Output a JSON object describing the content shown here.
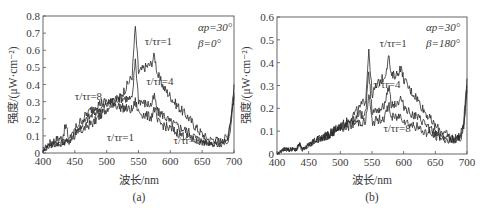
{
  "figure": {
    "panels": [
      {
        "id": "a",
        "caption": "(a)",
        "xlabel": "波长/nm",
        "ylabel": "强度/(μW·cm⁻²)",
        "params": [
          "αp=30°",
          "β=0°"
        ],
        "curve_labels": [
          {
            "text": "τ/τr=1",
            "x": 560,
            "y": 0.63
          },
          {
            "text": "τ/τr=4",
            "x": 562,
            "y": 0.4
          },
          {
            "text": "τ/τr=8",
            "x": 450,
            "y": 0.31
          },
          {
            "text": "τ/τr=1",
            "x": 500,
            "y": 0.07
          },
          {
            "text": "τ/τr=8",
            "x": 605,
            "y": 0.05
          }
        ]
      },
      {
        "id": "b",
        "caption": "(b)",
        "xlabel": "波长/nm",
        "ylabel": "强度/(μW·cm⁻²)",
        "params": [
          "αp=30°",
          "β=180°"
        ],
        "curve_labels": [
          {
            "text": "τ/τr=1",
            "x": 562,
            "y": 0.47
          },
          {
            "text": "τ/τr=4",
            "x": 552,
            "y": 0.29
          },
          {
            "text": "τ/τr=8",
            "x": 568,
            "y": 0.095
          }
        ]
      }
    ]
  },
  "chart_data": [
    {
      "type": "line",
      "title": "(a)",
      "xlabel": "波长/nm",
      "ylabel": "强度/(μW·cm⁻²)",
      "xlim": [
        400,
        700
      ],
      "ylim": [
        0,
        0.8
      ],
      "xticks": [
        400,
        450,
        500,
        550,
        600,
        650,
        700
      ],
      "yticks": [
        0,
        0.1,
        0.2,
        0.3,
        0.4,
        0.5,
        0.6,
        0.7,
        0.8
      ],
      "grid": false,
      "legend": "inline annotations",
      "annotations": [
        "αp=30°",
        "β=0°"
      ],
      "x": [
        400,
        410,
        420,
        430,
        436,
        440,
        450,
        460,
        470,
        480,
        490,
        500,
        510,
        520,
        530,
        540,
        545,
        550,
        560,
        570,
        575,
        580,
        590,
        600,
        610,
        620,
        630,
        640,
        650,
        660,
        670,
        680,
        690,
        695,
        700
      ],
      "series": [
        {
          "name": "τ/τr=1",
          "values": [
            0.02,
            0.06,
            0.08,
            0.09,
            0.16,
            0.09,
            0.1,
            0.13,
            0.16,
            0.18,
            0.22,
            0.26,
            0.3,
            0.32,
            0.38,
            0.45,
            0.74,
            0.47,
            0.5,
            0.52,
            0.57,
            0.46,
            0.38,
            0.33,
            0.28,
            0.24,
            0.2,
            0.15,
            0.11,
            0.08,
            0.08,
            0.07,
            0.1,
            0.2,
            0.4
          ]
        },
        {
          "name": "τ/τr=4",
          "values": [
            0.01,
            0.05,
            0.06,
            0.06,
            0.08,
            0.06,
            0.12,
            0.16,
            0.2,
            0.23,
            0.26,
            0.28,
            0.31,
            0.32,
            0.32,
            0.31,
            0.55,
            0.31,
            0.29,
            0.28,
            0.33,
            0.24,
            0.22,
            0.18,
            0.16,
            0.14,
            0.12,
            0.09,
            0.07,
            0.06,
            0.06,
            0.06,
            0.08,
            0.18,
            0.35
          ]
        },
        {
          "name": "τ/τr=8",
          "values": [
            0.01,
            0.04,
            0.05,
            0.05,
            0.07,
            0.05,
            0.14,
            0.19,
            0.23,
            0.27,
            0.29,
            0.3,
            0.29,
            0.27,
            0.26,
            0.25,
            0.3,
            0.24,
            0.22,
            0.21,
            0.26,
            0.18,
            0.16,
            0.14,
            0.12,
            0.1,
            0.09,
            0.07,
            0.06,
            0.05,
            0.05,
            0.05,
            0.07,
            0.16,
            0.33
          ]
        }
      ]
    },
    {
      "type": "line",
      "title": "(b)",
      "xlabel": "波长/nm",
      "ylabel": "强度/(μW·cm⁻²)",
      "xlim": [
        400,
        700
      ],
      "ylim": [
        0,
        0.6
      ],
      "xticks": [
        400,
        450,
        500,
        550,
        600,
        650,
        700
      ],
      "yticks": [
        0,
        0.1,
        0.2,
        0.3,
        0.4,
        0.5,
        0.6
      ],
      "grid": false,
      "legend": "inline annotations",
      "annotations": [
        "αp=30°",
        "β=180°"
      ],
      "x": [
        400,
        410,
        420,
        430,
        436,
        440,
        450,
        460,
        470,
        480,
        490,
        500,
        510,
        520,
        530,
        540,
        545,
        550,
        560,
        570,
        577,
        580,
        590,
        595,
        600,
        610,
        620,
        630,
        640,
        650,
        660,
        670,
        680,
        690,
        695,
        700
      ],
      "series": [
        {
          "name": "τ/τr=1",
          "values": [
            0.0,
            0.02,
            0.02,
            0.02,
            0.04,
            0.02,
            0.04,
            0.06,
            0.07,
            0.08,
            0.1,
            0.12,
            0.14,
            0.17,
            0.2,
            0.24,
            0.46,
            0.26,
            0.31,
            0.34,
            0.43,
            0.34,
            0.35,
            0.38,
            0.33,
            0.28,
            0.25,
            0.2,
            0.16,
            0.12,
            0.1,
            0.08,
            0.07,
            0.08,
            0.15,
            0.33
          ]
        },
        {
          "name": "τ/τr=4",
          "values": [
            0.0,
            0.02,
            0.02,
            0.02,
            0.04,
            0.02,
            0.04,
            0.06,
            0.07,
            0.08,
            0.1,
            0.12,
            0.13,
            0.15,
            0.17,
            0.18,
            0.36,
            0.19,
            0.2,
            0.21,
            0.3,
            0.22,
            0.22,
            0.24,
            0.21,
            0.18,
            0.16,
            0.14,
            0.11,
            0.09,
            0.08,
            0.07,
            0.06,
            0.08,
            0.13,
            0.3
          ]
        },
        {
          "name": "τ/τr=8",
          "values": [
            0.0,
            0.02,
            0.02,
            0.02,
            0.04,
            0.02,
            0.04,
            0.06,
            0.07,
            0.08,
            0.1,
            0.11,
            0.12,
            0.13,
            0.14,
            0.14,
            0.26,
            0.14,
            0.15,
            0.16,
            0.22,
            0.16,
            0.16,
            0.17,
            0.15,
            0.13,
            0.12,
            0.1,
            0.09,
            0.08,
            0.07,
            0.06,
            0.06,
            0.07,
            0.12,
            0.28
          ]
        }
      ]
    }
  ]
}
